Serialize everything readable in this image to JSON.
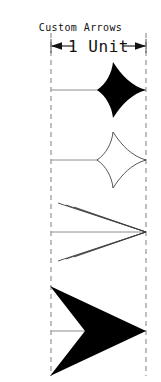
{
  "drawing": {
    "title": "Custom Arrows",
    "dimension_label": "1 Unit",
    "width_px": 161,
    "height_px": 382,
    "colors": {
      "background": "#ffffff",
      "ink": "#000000",
      "reference_line": "#8a8a8a",
      "shaft": "#8e8e8e",
      "outline": "#2b2b2b"
    },
    "reference_lines": {
      "left_x": 51,
      "right_x": 146,
      "top_y": 33,
      "bottom_y": 376,
      "dash_pattern": "5 4"
    },
    "dimension": {
      "label": "1 Unit",
      "y": 46,
      "left_x": 51,
      "right_x": 146,
      "left_arrow_direction": "left",
      "right_arrow_direction": "right",
      "extension_tick_height": 13
    },
    "arrows": [
      {
        "index": 1,
        "name": "solid-swallowtail-arrow",
        "style": "filled",
        "shape": "concave swept swallowtail",
        "fill": "#000000",
        "shaft_y": 90,
        "shaft_start_x": 51,
        "tip_x": 146,
        "head_length": 58,
        "head_half_width": 29
      },
      {
        "index": 2,
        "name": "hollow-swallowtail-arrow",
        "style": "outlined",
        "shape": "concave swept swallowtail",
        "fill": "#ffffff",
        "stroke": "#2b2b2b",
        "shaft_y": 160,
        "shaft_start_x": 51,
        "tip_x": 146,
        "head_length": 58,
        "head_half_width": 29
      },
      {
        "index": 3,
        "name": "triple-barb-chevron-arrow",
        "style": "stroked",
        "shape": "three nested open chevrons",
        "stroke": "#3a3a3a",
        "shaft_y": 232,
        "shaft_start_x": 51,
        "tip_x": 146,
        "barb_count": 3,
        "head_length": 90,
        "head_half_width": 40
      },
      {
        "index": 4,
        "name": "solid-barbed-arrow",
        "style": "filled",
        "shape": "straight-edged barbed head with V notch",
        "fill": "#000000",
        "shaft_y": 331,
        "shaft_start_x": 51,
        "tip_x": 146,
        "head_length": 96,
        "head_half_width": 45
      }
    ]
  }
}
